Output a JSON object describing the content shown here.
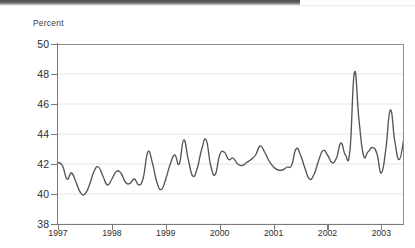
{
  "chart_data": {
    "type": "line",
    "title": "",
    "subtitle": "",
    "xlabel": "",
    "ylabel": "Percent",
    "ylim": [
      38,
      50
    ],
    "ytick_labels": [
      "38",
      "40",
      "42",
      "44",
      "46",
      "48",
      "50"
    ],
    "yticks": [
      38,
      40,
      42,
      44,
      46,
      48,
      50
    ],
    "xtick_labels": [
      "1997",
      "1998",
      "1999",
      "2000",
      "2001",
      "2002",
      "2003"
    ],
    "xticks": [
      1997,
      1998,
      1999,
      2000,
      2001,
      2002,
      2003
    ],
    "xlim": [
      1997,
      2003.42
    ],
    "grid": "horizontal",
    "legend": "none",
    "series": [
      {
        "name": "Percent",
        "color": "#555555",
        "x": [
          1997.0,
          1997.083,
          1997.167,
          1997.25,
          1997.333,
          1997.417,
          1997.5,
          1997.583,
          1997.667,
          1997.75,
          1997.833,
          1997.917,
          1998.0,
          1998.083,
          1998.167,
          1998.25,
          1998.333,
          1998.417,
          1998.5,
          1998.583,
          1998.667,
          1998.75,
          1998.833,
          1998.917,
          1999.0,
          1999.083,
          1999.167,
          1999.25,
          1999.333,
          1999.417,
          1999.5,
          1999.583,
          1999.667,
          1999.75,
          1999.833,
          1999.917,
          2000.0,
          2000.083,
          2000.167,
          2000.25,
          2000.333,
          2000.417,
          2000.5,
          2000.583,
          2000.667,
          2000.75,
          2000.833,
          2000.917,
          2001.0,
          2001.083,
          2001.167,
          2001.25,
          2001.333,
          2001.417,
          2001.5,
          2001.583,
          2001.667,
          2001.75,
          2001.833,
          2001.917,
          2002.0,
          2002.083,
          2002.167,
          2002.25,
          2002.333,
          2002.417,
          2002.5,
          2002.583,
          2002.667,
          2002.75,
          2002.833,
          2002.917,
          2003.0,
          2003.083,
          2003.167,
          2003.25,
          2003.333,
          2003.417
        ],
        "values": [
          42.1,
          41.9,
          41.0,
          41.4,
          40.8,
          40.1,
          40.0,
          40.6,
          41.5,
          41.8,
          41.2,
          40.6,
          41.0,
          41.5,
          41.4,
          40.8,
          40.7,
          41.0,
          40.6,
          41.1,
          42.8,
          42.1,
          40.8,
          40.3,
          41.0,
          42.0,
          42.6,
          42.0,
          43.6,
          42.3,
          41.2,
          41.7,
          43.0,
          43.6,
          41.9,
          41.3,
          42.6,
          42.8,
          42.3,
          42.4,
          42.0,
          41.9,
          42.1,
          42.3,
          42.6,
          43.2,
          42.8,
          42.2,
          41.8,
          41.6,
          41.6,
          41.8,
          41.9,
          43.0,
          42.6,
          41.7,
          41.0,
          41.3,
          42.2,
          42.9,
          42.6,
          42.1,
          42.4,
          43.4,
          42.6,
          42.9,
          48.1,
          45.0,
          42.6,
          42.8,
          43.1,
          42.7,
          43.0,
          41.5,
          43.4,
          45.9,
          44.8,
          42.0
        ]
      }
    ]
  },
  "chart_extra": {
    "series_tail": {
      "x": [
        2003.0,
        2003.083,
        2003.167,
        2003.25,
        2003.333,
        2003.417
      ],
      "values": [
        41.4,
        43.0,
        45.6,
        43.5,
        42.3,
        43.7
      ]
    }
  }
}
